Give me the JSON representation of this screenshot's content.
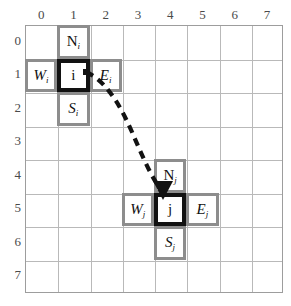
{
  "figure": {
    "type": "grid-diagram",
    "grid": {
      "columns": 8,
      "rows": 8,
      "col_labels": [
        "0",
        "1",
        "2",
        "3",
        "4",
        "5",
        "6",
        "7"
      ],
      "row_labels": [
        "0",
        "1",
        "2",
        "3",
        "4",
        "5",
        "6",
        "7"
      ],
      "line_color": "#b9b9b9",
      "border_color": "#9d9d9d"
    },
    "cells": [
      {
        "id": "cell-N-i",
        "label": "N",
        "sub": "i",
        "upright": true,
        "style": "neighbour",
        "col": 1,
        "row": 0
      },
      {
        "id": "cell-W-i",
        "label": "W",
        "sub": "i",
        "upright": false,
        "style": "neighbour",
        "col": 0,
        "row": 1
      },
      {
        "id": "cell-i",
        "label": "i",
        "sub": "",
        "upright": true,
        "style": "core",
        "col": 1,
        "row": 1
      },
      {
        "id": "cell-E-i",
        "label": "E",
        "sub": "i",
        "upright": false,
        "style": "neighbour",
        "col": 2,
        "row": 1
      },
      {
        "id": "cell-S-i",
        "label": "S",
        "sub": "i",
        "upright": false,
        "style": "neighbour",
        "col": 1,
        "row": 2
      },
      {
        "id": "cell-N-j",
        "label": "N",
        "sub": "j",
        "upright": true,
        "style": "neighbour",
        "col": 4,
        "row": 4
      },
      {
        "id": "cell-W-j",
        "label": "W",
        "sub": "j",
        "upright": false,
        "style": "neighbour",
        "col": 3,
        "row": 5
      },
      {
        "id": "cell-j",
        "label": "j",
        "sub": "",
        "upright": true,
        "style": "core",
        "col": 4,
        "row": 5
      },
      {
        "id": "cell-E-j",
        "label": "E",
        "sub": "j",
        "upright": false,
        "style": "neighbour",
        "col": 5,
        "row": 5
      },
      {
        "id": "cell-S-j",
        "label": "S",
        "sub": "j",
        "upright": false,
        "style": "neighbour",
        "col": 4,
        "row": 6
      }
    ],
    "connector": {
      "name": "dashed-arrow-i-to-j",
      "from": "cell-i",
      "to": "cell-j",
      "style": "dashed",
      "color": "#121212",
      "arrowhead": "filled-triangle-down"
    },
    "colors": {
      "neighbour_frame": "#8d8d8d",
      "core_frame": "#121212",
      "cell_fill": "#ffffff",
      "background": "#ffffff",
      "tick_text": "#4a4a4a"
    }
  }
}
